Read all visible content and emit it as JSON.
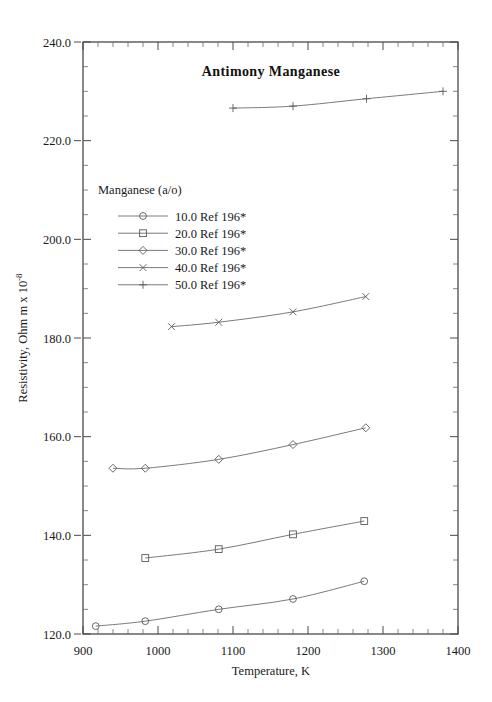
{
  "chart_data": {
    "type": "line",
    "title": "Antimony  Manganese",
    "xlabel": "Temperature,  K",
    "ylabel": "Resistivity, Ohm m x 10",
    "ylabel_exponent": "-8",
    "xlim": [
      900,
      1400
    ],
    "ylim": [
      120.0,
      240.0
    ],
    "xticks": [
      900,
      1000,
      1100,
      1200,
      1300,
      1400
    ],
    "xticklabels": [
      "900",
      "1000",
      "1100",
      "1200",
      "1300",
      "1400"
    ],
    "yticks": [
      120.0,
      140.0,
      160.0,
      180.0,
      200.0,
      220.0,
      240.0
    ],
    "yticklabels": [
      "120.0",
      "140.0",
      "160.0",
      "180.0",
      "200.0",
      "220.0",
      "240.0"
    ],
    "x_minor_step": 20,
    "y_minor_step": 5,
    "grid": false,
    "legend_position": "upper-left-inside",
    "legend_title": "Manganese (a/o)",
    "series": [
      {
        "name": "10.0 Ref 196*",
        "marker": "circle",
        "points": [
          {
            "x": 917,
            "y": 121.6
          },
          {
            "x": 983,
            "y": 122.6
          },
          {
            "x": 1081,
            "y": 125.0
          },
          {
            "x": 1180,
            "y": 127.1
          },
          {
            "x": 1275,
            "y": 130.7
          }
        ]
      },
      {
        "name": "20.0 Ref 196*",
        "marker": "square",
        "points": [
          {
            "x": 983,
            "y": 135.4
          },
          {
            "x": 1081,
            "y": 137.2
          },
          {
            "x": 1180,
            "y": 140.2
          },
          {
            "x": 1275,
            "y": 142.9
          }
        ]
      },
      {
        "name": "30.0 Ref 196*",
        "marker": "diamond",
        "points": [
          {
            "x": 940,
            "y": 153.6
          },
          {
            "x": 983,
            "y": 153.6
          },
          {
            "x": 1081,
            "y": 155.4
          },
          {
            "x": 1180,
            "y": 158.4
          },
          {
            "x": 1277,
            "y": 161.8
          }
        ]
      },
      {
        "name": "40.0 Ref 196*",
        "marker": "cross",
        "points": [
          {
            "x": 1018,
            "y": 182.3
          },
          {
            "x": 1081,
            "y": 183.2
          },
          {
            "x": 1180,
            "y": 185.3
          },
          {
            "x": 1277,
            "y": 188.4
          }
        ]
      },
      {
        "name": "50.0 Ref 196*",
        "marker": "plus",
        "points": [
          {
            "x": 1100,
            "y": 226.6
          },
          {
            "x": 1180,
            "y": 227.0
          },
          {
            "x": 1278,
            "y": 228.5
          },
          {
            "x": 1380,
            "y": 230.0
          }
        ]
      }
    ]
  },
  "colors": {
    "background": "#ffffff",
    "axis": "#4a4a4a",
    "data": "#6b6b6b",
    "text": "#1a1a1a"
  }
}
